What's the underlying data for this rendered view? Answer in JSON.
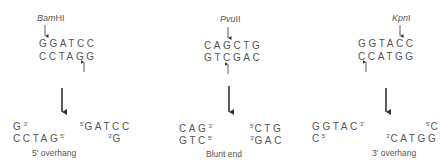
{
  "panels": [
    {
      "enzyme": "BamHI",
      "enzyme_parts": {
        "italic": "Bam",
        "roman": "HI"
      },
      "top_strand": "GGATCC",
      "bottom_strand": "CCTAGG",
      "left_top": "G",
      "left_top_end": "3'",
      "left_bottom": "CCTAG",
      "left_bottom_end": "5'",
      "right_top_end": "5'",
      "right_top": "GATCC",
      "right_bottom_end": "3'",
      "right_bottom": "G",
      "result_label": "5' overhang"
    },
    {
      "enzyme": "PvuII",
      "enzyme_parts": {
        "italic": "Pvu",
        "roman": "II"
      },
      "top_strand": "CAGCTG",
      "bottom_strand": "GTCGAC",
      "left_top": "CAG",
      "left_top_end": "3'",
      "left_bottom": "GTC",
      "left_bottom_end": "5'",
      "right_top_end": "5'",
      "right_top": "CTG",
      "right_bottom_end": "3'",
      "right_bottom": "GAC",
      "result_label": "Blunt end"
    },
    {
      "enzyme": "KpnI",
      "enzyme_parts": {
        "italic": "Kpn",
        "roman": "I"
      },
      "top_strand": "GGTACC",
      "bottom_strand": "CCATGG",
      "left_top": "GGTAC",
      "left_top_end": "3'",
      "left_bottom": "C",
      "left_bottom_end": "5'",
      "right_top_end": "5'",
      "right_top": "C",
      "right_bottom_end": "3'",
      "right_bottom": "CATGG",
      "result_label": "3' overhang"
    }
  ]
}
